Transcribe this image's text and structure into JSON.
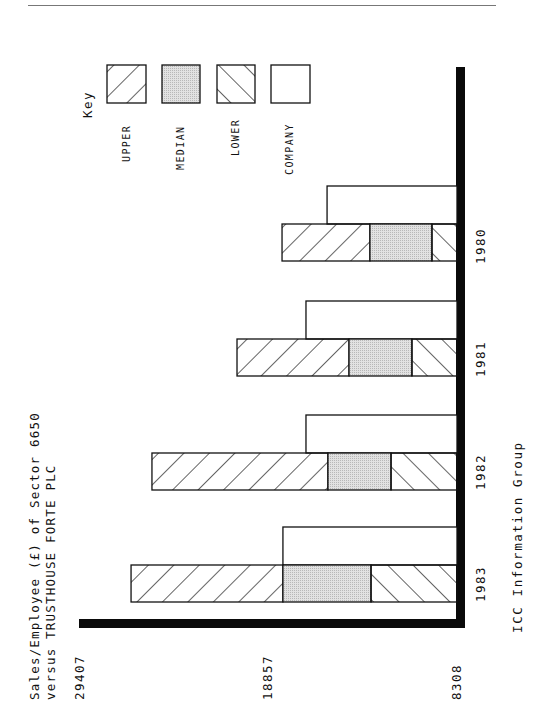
{
  "page": {
    "footer": "ICC Information Group"
  },
  "chart_data": {
    "type": "bar",
    "orientation": "horizontal (page rotated 90°; value axis decreases toward bars' base)",
    "title": "Sales/Employee (£) of Sector 6650",
    "subtitle": "versus TRUSTHOUSE FORTE PLC",
    "xlabel": "",
    "ylabel": "Sales/Employee (£)",
    "ticks": [
      "29407",
      "18857",
      "8308"
    ],
    "tick_values": [
      29407,
      18857,
      8308
    ],
    "axis_range": [
      8308,
      29407
    ],
    "grid": false,
    "legend_position": "top (key)",
    "legend_title": "Key",
    "legend": [
      "UPPER",
      "MEDIAN",
      "LOWER",
      "COMPANY"
    ],
    "categories": [
      "1980",
      "1981",
      "1982",
      "1983"
    ],
    "series": [
      {
        "name": "UPPER",
        "values": [
          18100,
          20620,
          25380,
          26550
        ]
      },
      {
        "name": "MEDIAN",
        "values": [
          13180,
          14350,
          15530,
          18050
        ]
      },
      {
        "name": "LOWER",
        "values": [
          9710,
          10830,
          12000,
          13120
        ]
      },
      {
        "name": "COMPANY",
        "values": [
          15580,
          16760,
          16760,
          18050
        ]
      }
    ]
  }
}
